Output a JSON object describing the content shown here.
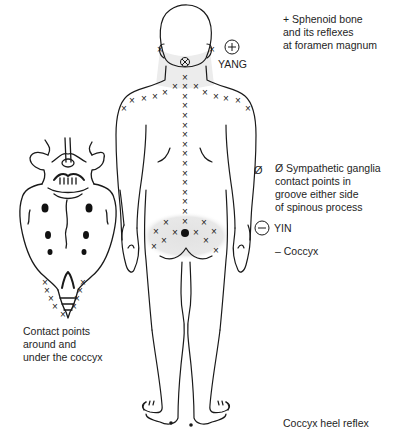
{
  "diagram": {
    "annotations": {
      "sphenoid": {
        "symbol": "+",
        "text_lines": [
          "+ Sphenoid bone",
          "and its reflexes",
          "at foramen magnum"
        ]
      },
      "yang": {
        "symbol": "+",
        "label": "YANG"
      },
      "sympathetic": {
        "symbol": "Ø",
        "text_lines": [
          "Ø Sympathetic ganglia",
          "contact points in",
          "groove either side",
          "of spinous process"
        ]
      },
      "yin": {
        "symbol": "−",
        "label": "YIN"
      },
      "coccyx": {
        "text": "– Coccyx"
      },
      "sacrum_caption": {
        "text_lines": [
          "Contact points",
          "around and",
          "under the coccyx"
        ]
      },
      "heel_reflex": {
        "text": "Coccyx heel reflex"
      }
    },
    "markers": {
      "contact_point": "×",
      "foramen_magnum_point": "⊗",
      "coccyx_point": "●"
    },
    "colors": {
      "line": "#1a1a1a",
      "shade": "#e6e6e6",
      "background": "#ffffff"
    }
  }
}
